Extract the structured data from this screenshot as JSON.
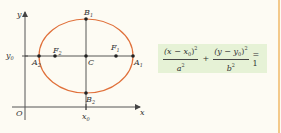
{
  "diagram": {
    "type": "ellipse-with-translated-center",
    "axes": {
      "x_label": "x",
      "y_label": "y",
      "origin_label": "O"
    },
    "ticks": {
      "x0_label": "x",
      "x0_sub": "0",
      "y0_label": "y",
      "y0_sub": "0"
    },
    "points": {
      "center": "C",
      "A1": {
        "base": "A",
        "sub": "1"
      },
      "A2": {
        "base": "A",
        "sub": "2"
      },
      "B1": {
        "base": "B",
        "sub": "1"
      },
      "B2": {
        "base": "B",
        "sub": "2"
      },
      "F1": {
        "base": "F",
        "sub": "1"
      },
      "F2": {
        "base": "F",
        "sub": "2"
      }
    },
    "colors": {
      "ellipse": "#e0703a",
      "axes": "#444444",
      "formula_bg": "#e6f2d6",
      "page_bg": "#fdfbf3",
      "edge_rule": "#f3c98a"
    }
  },
  "formula": {
    "term1_num_a": "(x − x",
    "term1_num_sub": "0",
    "term1_num_b": ")",
    "term1_num_sup": "2",
    "term1_den": "a",
    "term1_den_sup": "2",
    "plus": "+",
    "term2_num_a": "(y − y",
    "term2_num_sub": "0",
    "term2_num_b": ")",
    "term2_num_sup": "2",
    "term2_den": "b",
    "term2_den_sup": "2",
    "equals": "= 1"
  }
}
